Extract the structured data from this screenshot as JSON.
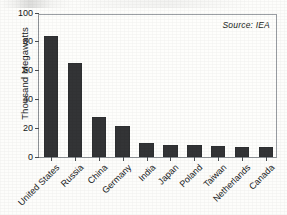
{
  "chart_data": {
    "type": "bar",
    "title": "",
    "xlabel": "",
    "ylabel": "Thousand Megawatts",
    "ylim": [
      0,
      100
    ],
    "yticks": [
      0,
      20,
      40,
      60,
      80,
      100
    ],
    "grid": false,
    "legend": null,
    "orientation": "vertical",
    "bar_color": "#333436",
    "annotations": [
      {
        "name": "source-note",
        "text": "Source: IEA",
        "position": "top-right-inside",
        "style": "italic"
      }
    ],
    "categories": [
      "United States",
      "Russia",
      "China",
      "Germany",
      "India",
      "Japan",
      "Poland",
      "Taiwan",
      "Netherlands",
      "Canada"
    ],
    "values": [
      84,
      65,
      28,
      21.5,
      10,
      8.5,
      8.2,
      7.6,
      7.3,
      7
    ]
  },
  "figure": {
    "background_color": "#fdfdfb",
    "frame_color": "#8d9196",
    "text_color": "#16181a"
  }
}
